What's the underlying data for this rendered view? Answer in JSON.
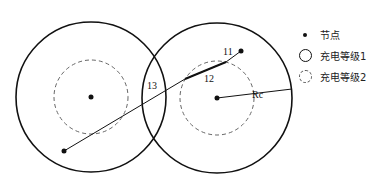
{
  "diagram": {
    "labels": {
      "l1": "11",
      "l2": "12",
      "l3": "13",
      "radius": "Rc"
    },
    "colors": {
      "stroke": "#111111",
      "dashed": "#555555",
      "background": "#ffffff"
    }
  },
  "legend": {
    "items": [
      {
        "symbol": "dot-icon",
        "label": "节点"
      },
      {
        "symbol": "solid-circle-icon",
        "label": "充电等级1"
      },
      {
        "symbol": "dashed-circle-icon",
        "label": "充电等级2"
      }
    ]
  }
}
